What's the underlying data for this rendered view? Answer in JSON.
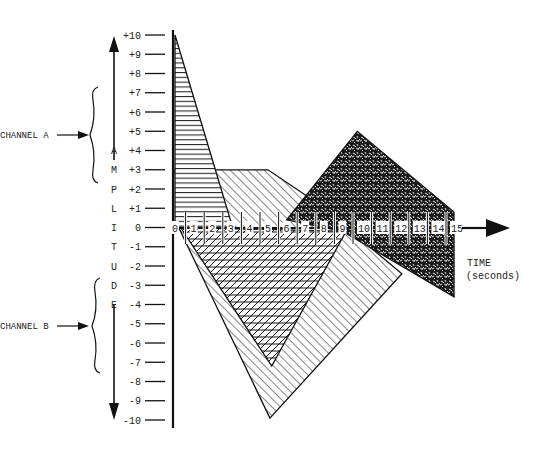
{
  "chart_data": {
    "type": "area",
    "title": "",
    "ylabel": "AMPLITUDE",
    "ylabel_letters": [
      "A",
      "M",
      "P",
      "L",
      "I",
      "T",
      "U",
      "D",
      "E"
    ],
    "xlabel_line1": "TIME",
    "xlabel_line2": "(seconds)",
    "xlim": [
      0,
      15
    ],
    "ylim": [
      -10,
      10
    ],
    "x_ticks": [
      "0",
      "1",
      "2",
      "3",
      "4",
      "5",
      "6",
      "7",
      "8",
      "9",
      "10",
      "11",
      "12",
      "13",
      "14",
      "15"
    ],
    "y_ticks": [
      "+10",
      "+9",
      "+8",
      "+7",
      "+6",
      "+5",
      "+4",
      "+3",
      "+2",
      "+1",
      "0",
      "-1",
      "-2",
      "-3",
      "-4",
      "-5",
      "-6",
      "-7",
      "-8",
      "-9",
      "-10"
    ],
    "y_tick_values": [
      10,
      9,
      8,
      7,
      6,
      5,
      4,
      3,
      2,
      1,
      0,
      -1,
      -2,
      -3,
      -4,
      -5,
      -6,
      -7,
      -8,
      -9,
      -10
    ],
    "channels": [
      {
        "name": "CHANNEL A",
        "range": [
          3,
          10
        ]
      },
      {
        "name": "CHANNEL B",
        "range": [
          -6,
          -3
        ]
      }
    ],
    "series": [
      {
        "name": "region-horizontal-hatch",
        "fill": "horizontal-lines",
        "points": [
          [
            0,
            10
          ],
          [
            3.1,
            0
          ],
          [
            0,
            0
          ]
        ]
      },
      {
        "name": "region-diagonal-hatch",
        "fill": "diagonal-lines",
        "points": [
          [
            0,
            3
          ],
          [
            5,
            3
          ],
          [
            7.6,
            1.3
          ],
          [
            12.2,
            -2.4
          ],
          [
            5.1,
            -9.9
          ],
          [
            0.2,
            0
          ]
        ]
      },
      {
        "name": "region-crosshatch",
        "fill": "cross-lines",
        "points": [
          [
            0.3,
            0
          ],
          [
            5.2,
            -7.2
          ],
          [
            9.2,
            -0.2
          ]
        ]
      },
      {
        "name": "region-stipple",
        "fill": "dense-stipple",
        "points": [
          [
            6.0,
            0.4
          ],
          [
            9.8,
            5.0
          ],
          [
            15,
            0.8
          ],
          [
            15,
            -3.6
          ],
          [
            9.0,
            -0.2
          ]
        ]
      }
    ]
  }
}
